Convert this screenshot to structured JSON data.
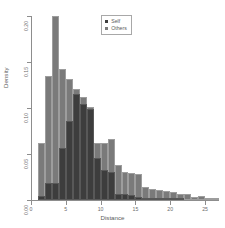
{
  "chart_data": {
    "type": "bar",
    "subtype": "overlaid-histogram",
    "title": "",
    "xlabel": "Distance",
    "ylabel": "Density",
    "xlim": [
      0,
      27
    ],
    "ylim": [
      0,
      0.2
    ],
    "grid": false,
    "bin_width": 1,
    "legend": {
      "position": "top-right",
      "entries": [
        {
          "name": "Self",
          "color": "#3d3d3d"
        },
        {
          "name": "Others",
          "color": "#7a7a7a"
        }
      ]
    },
    "xticks": [
      0,
      5,
      10,
      15,
      20,
      25
    ],
    "xtick_labels": [
      "0",
      "5",
      "10",
      "15",
      "20",
      "25"
    ],
    "yticks": [
      0.0,
      0.05,
      0.1,
      0.15,
      0.2
    ],
    "ytick_labels": [
      "0.00",
      "0.05",
      "0.10",
      "0.15",
      "0.20"
    ],
    "bin_starts": [
      1,
      2,
      3,
      4,
      5,
      6,
      7,
      8,
      9,
      10,
      11,
      12,
      13,
      14,
      15,
      16,
      17,
      18,
      19,
      20,
      21,
      22,
      23,
      24,
      25,
      26
    ],
    "series": [
      {
        "name": "Others",
        "color": "#7a7a7a",
        "values": [
          0.062,
          0.135,
          0.2,
          0.142,
          0.131,
          0.121,
          0.112,
          0.101,
          0.062,
          0.062,
          0.066,
          0.038,
          0.03,
          0.029,
          0.028,
          0.014,
          0.012,
          0.011,
          0.01,
          0.009,
          0.007,
          0.006,
          0.003,
          0.004,
          0.002,
          0.001
        ]
      },
      {
        "name": "Self",
        "color": "#3d3d3d",
        "values": [
          0.004,
          0.018,
          0.018,
          0.056,
          0.086,
          0.115,
          0.104,
          0.099,
          0.046,
          0.033,
          0.03,
          0.006,
          0.006,
          0.005,
          0.003,
          0.002,
          0.002,
          0.001,
          0.001,
          0.001,
          0.001,
          0.0,
          0.0,
          0.0,
          0.0,
          0.0
        ]
      }
    ]
  }
}
